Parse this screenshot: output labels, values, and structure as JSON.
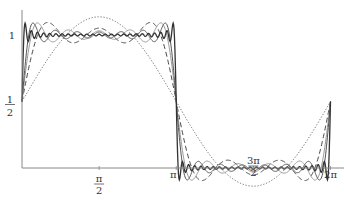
{
  "chart_data": {
    "type": "line",
    "title": "",
    "xlabel": "",
    "ylabel": "",
    "x_range": [
      0,
      6.2832
    ],
    "y_range": [
      -0.15,
      1.15
    ],
    "grid": false,
    "legend": null,
    "x_ticks": [
      {
        "value": 1.5708,
        "label_num": "π",
        "label_den": "2"
      },
      {
        "value": 3.1416,
        "label": "π"
      },
      {
        "value": 4.7124,
        "label_num": "3π",
        "label_den": "2"
      },
      {
        "value": 6.2832,
        "label": "2π"
      }
    ],
    "y_ticks": [
      {
        "value": 1,
        "label": "1"
      },
      {
        "value": 0.5,
        "label_num": "1",
        "label_den": "2"
      }
    ],
    "series": [
      {
        "name": "S1",
        "terms": 1,
        "style": "dotted",
        "color": "#555555",
        "width": 0.9
      },
      {
        "name": "S3",
        "terms": 3,
        "style": "dashed",
        "color": "#444444",
        "width": 1.0
      },
      {
        "name": "S5",
        "terms": 5,
        "style": "solid",
        "color": "#999999",
        "width": 1.0
      },
      {
        "name": "S7",
        "terms": 7,
        "style": "solid",
        "color": "#555555",
        "width": 1.0
      },
      {
        "name": "S25",
        "terms": 25,
        "style": "solid",
        "color": "#333333",
        "width": 1.3
      }
    ]
  },
  "plot": {
    "origin_x": 22,
    "origin_y": 168,
    "px_per_x": 49.1,
    "px_per_y": 133,
    "axis_color": "#888888"
  }
}
